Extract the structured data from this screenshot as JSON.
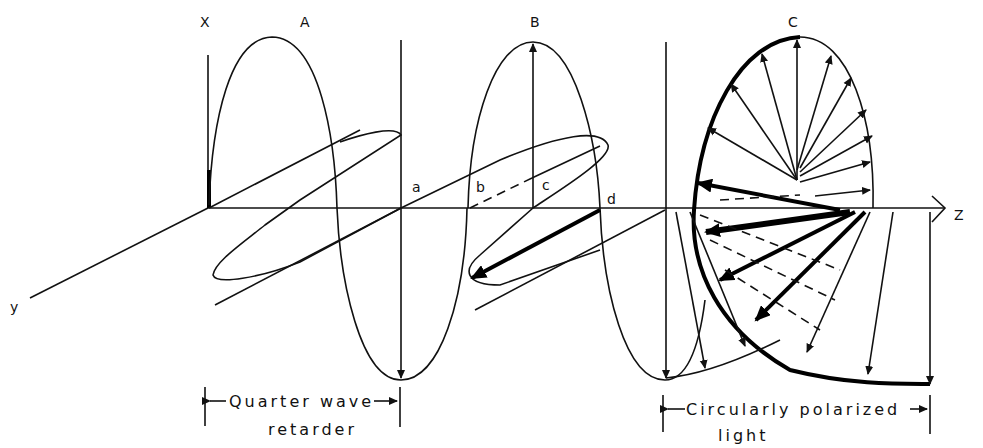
{
  "figure": {
    "axis_labels": {
      "x": "X",
      "y": "y",
      "z": "Z"
    },
    "region_labels": {
      "A": "A",
      "B": "B",
      "C": "C"
    },
    "point_labels": {
      "a": "a",
      "b": "b",
      "c": "c",
      "d": "d"
    },
    "captions": {
      "quarter_wave_line1": "Quarter wave",
      "quarter_wave_line2": "retarder",
      "circular_line1": "Circularly polarized",
      "circular_line2": "light"
    },
    "colors": {
      "ink": "#111111",
      "background": "#ffffff"
    }
  }
}
